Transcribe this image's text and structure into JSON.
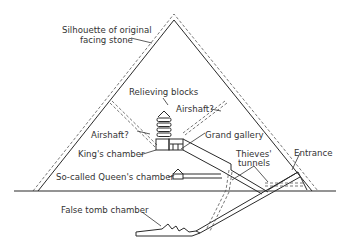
{
  "diagram": {
    "colors": {
      "line": "#2a2a2a",
      "text": "#333333",
      "background": "#ffffff"
    },
    "labels": {
      "silhouette_line1": "Silhouette of original",
      "silhouette_line2": "facing stone",
      "relieving_blocks": "Relieving blocks",
      "airshaft_right": "Airshaft?",
      "airshaft_left": "Airshaft?",
      "grand_gallery": "Grand gallery",
      "kings_chamber": "King's chamber",
      "thieves_tunnels_line1": "Thieves'",
      "thieves_tunnels_line2": "tunnels",
      "entrance": "Entrance",
      "queens_chamber": "So-called Queen's chamber",
      "false_tomb_chamber": "False tomb chamber"
    }
  }
}
